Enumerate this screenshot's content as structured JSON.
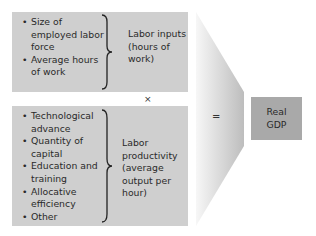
{
  "top_panel": {
    "factors": [
      "Size of employed labor force",
      "Average hours of work"
    ],
    "result": "Labor inputs (hours of work)"
  },
  "operator_times": "×",
  "bottom_panel": {
    "factors": [
      "Technological advance",
      "Quantity of capital",
      "Education and training",
      "Allocative efficiency",
      "Other"
    ],
    "result": "Labor productivity (average output per hour)"
  },
  "operator_equals": "=",
  "output": {
    "label": "Real\nGDP"
  },
  "colors": {
    "panel": "#cfcfcf",
    "output_box": "#a9a9a9",
    "funnel_dark": "#bdbdbd",
    "funnel_light": "#f4f4f4"
  }
}
